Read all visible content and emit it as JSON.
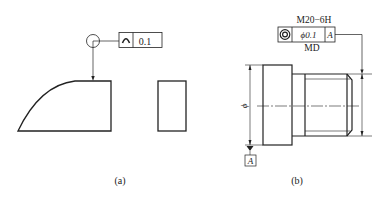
{
  "figure_a": {
    "caption": "(a)",
    "tolerance_frame": {
      "symbol": "profile-of-a-line-icon",
      "symbol_glyph": "⌒",
      "value": "0.1"
    },
    "modifier": "all-around-circle"
  },
  "figure_b": {
    "caption": "(b)",
    "thread_label": "M20−6H",
    "tolerance_frame": {
      "symbol": "concentricity-icon",
      "value": "ϕ0.1",
      "datum": "A"
    },
    "modifier_below": "MD",
    "diameter_label": "ϕ",
    "datum_label": "A"
  },
  "colors": {
    "line": "#222222",
    "background": "#ffffff"
  }
}
